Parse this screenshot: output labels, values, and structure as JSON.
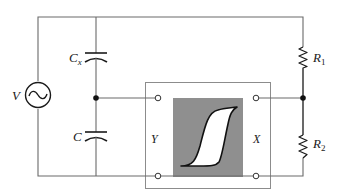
{
  "diagram": {
    "type": "circuit-schematic",
    "colors": {
      "wire": "#6a6a6a",
      "screen": "#8f8f8f",
      "loop_fill": "#ffffff",
      "loop_stroke": "#111111"
    },
    "labels": {
      "source": "V",
      "cap_top": "C",
      "cap_top_sub": "x",
      "cap_bottom": "C",
      "res_top": "R",
      "res_top_sub": "1",
      "res_bottom": "R",
      "res_bottom_sub": "2",
      "scope_y": "Y",
      "scope_x": "X"
    },
    "components": [
      {
        "id": "V",
        "kind": "ac-voltage-source"
      },
      {
        "id": "Cx",
        "kind": "capacitor"
      },
      {
        "id": "C",
        "kind": "capacitor"
      },
      {
        "id": "R1",
        "kind": "resistor"
      },
      {
        "id": "R2",
        "kind": "resistor"
      },
      {
        "id": "scope",
        "kind": "oscilloscope",
        "display": "hysteresis-loop"
      }
    ]
  }
}
